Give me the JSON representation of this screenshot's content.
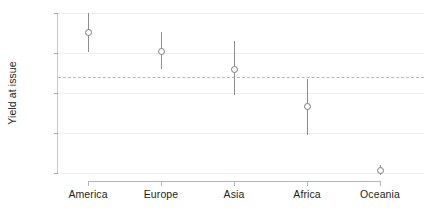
{
  "chart_data": {
    "type": "scatter",
    "title": "",
    "subtitle": "",
    "xlabel": "",
    "ylabel": "Yield at issue",
    "categories": [
      "America",
      "Europe",
      "Asia",
      "Africa",
      "Oceania"
    ],
    "values": [
      5.76,
      5.52,
      5.3,
      4.83,
      4.03
    ],
    "error_low": [
      5.51,
      5.3,
      4.97,
      4.47,
      3.97
    ],
    "error_high": [
      6.0,
      5.76,
      5.65,
      5.18,
      4.1
    ],
    "ylim": [
      4,
      6
    ],
    "yticks": [
      4,
      4.5,
      5,
      5.5,
      6
    ],
    "ytick_labels": [
      "4",
      "4.5",
      "5",
      "5.5",
      "6"
    ],
    "reference_line": 5.2,
    "reference_line_style": "dashed",
    "grid": "horizontal",
    "legend": "none",
    "marker_style": "open-circle",
    "errorbar_style": "vertical-line",
    "series": [
      {
        "name": "Yield at issue",
        "values": [
          5.76,
          5.52,
          5.3,
          4.83,
          4.03
        ],
        "error_low": [
          5.51,
          5.3,
          4.97,
          4.47,
          3.97
        ],
        "error_high": [
          6.0,
          5.76,
          5.65,
          5.18,
          4.1
        ]
      }
    ]
  },
  "colors": {
    "marker_stroke": "#7d7d7d",
    "errorbar": "#8d8d8d",
    "gridline": "#eeeeee",
    "reference_line": "#b9b7bd",
    "axis": "#b5b5b5",
    "text": "#231f20",
    "background": "#ffffff"
  }
}
